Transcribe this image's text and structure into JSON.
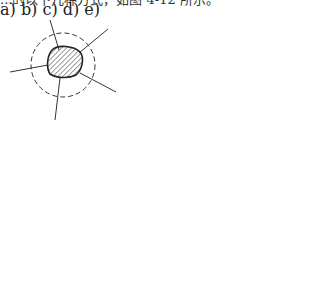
{
  "caption_fragment": "...的以下几种方式，如图 4-12 所示。",
  "panels": [
    {
      "id": "a",
      "label": "a)",
      "desc": "hatched blob with dashed circle and radial lines"
    },
    {
      "id": "b",
      "label": "b)",
      "desc": "hatched blob with dashed half circle, vertical line and horizontal line"
    },
    {
      "id": "c",
      "label": "c)",
      "desc": "hatched blob connected by dashed line to horizontal line above"
    },
    {
      "id": "d",
      "label": "d)",
      "desc": "two hatched blobs split by a diagonal curve"
    },
    {
      "id": "e",
      "label": "e)",
      "desc": "three hatched blobs separated by two crossing curves with dashed connectors"
    }
  ],
  "colors": {
    "stroke": "#222222",
    "hatch": "#333333",
    "background": "#ffffff"
  }
}
